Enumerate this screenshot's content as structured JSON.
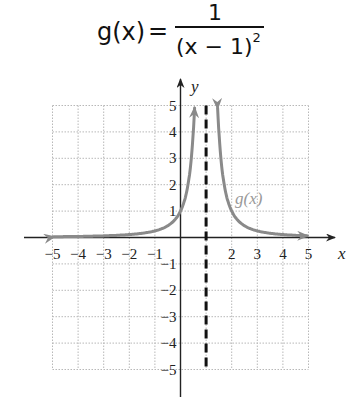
{
  "formula": {
    "lhs": "g(x)",
    "equals": "=",
    "numerator": "1",
    "denominator_base": "(x − 1)",
    "denominator_exponent": "2"
  },
  "chart_data": {
    "type": "line",
    "xlabel": "x",
    "ylabel": "y",
    "xlim": [
      -5,
      5
    ],
    "ylim": [
      -5,
      5
    ],
    "grid": true,
    "x_ticks": [
      "−5",
      "−4",
      "−3",
      "−2",
      "−1",
      "2",
      "3",
      "4",
      "5"
    ],
    "y_ticks": [
      "5",
      "4",
      "3",
      "2",
      "1",
      "−1",
      "−2",
      "−3",
      "−4",
      "−5"
    ],
    "series": [
      {
        "name": "g(x)",
        "color": "#8a8a8a",
        "function": "1/(x-1)^2",
        "x": [
          -5,
          -4,
          -3,
          -2,
          -1,
          0,
          0.5,
          0.55,
          1.45,
          1.5,
          2,
          3,
          4,
          5
        ],
        "values": [
          0.028,
          0.04,
          0.063,
          0.111,
          0.25,
          1,
          4,
          4.94,
          4.94,
          4,
          1,
          0.25,
          0.111,
          0.063
        ]
      }
    ],
    "annotations": [
      {
        "type": "vertical_asymptote",
        "x": 1,
        "style": "dashed",
        "color": "#111111"
      },
      {
        "type": "label",
        "text": "g(x)",
        "x": 2.2,
        "y": 1.4
      }
    ]
  },
  "labels": {
    "x_axis": "x",
    "y_axis": "y",
    "curve": "g(x)"
  },
  "colors": {
    "curve": "#8a8a8a",
    "axis": "#222222",
    "grid": "#b8b8b8",
    "asymptote": "#111111"
  }
}
